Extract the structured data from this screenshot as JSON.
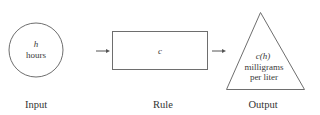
{
  "diagram": {
    "type": "function-machine",
    "input": {
      "shape": "circle",
      "variable": "h",
      "unit": "hours",
      "caption": "Input"
    },
    "rule": {
      "shape": "rectangle",
      "function_name": "c",
      "caption": "Rule"
    },
    "output": {
      "shape": "triangle",
      "expression": "c(h)",
      "unit_line1": "milligrams",
      "unit_line2": "per liter",
      "caption": "Output"
    },
    "connections": [
      {
        "from": "input",
        "to": "rule"
      },
      {
        "from": "rule",
        "to": "output"
      }
    ],
    "colors": {
      "stroke": "#6e6e6e",
      "text": "#3a3a3a",
      "background": "#ffffff"
    }
  }
}
